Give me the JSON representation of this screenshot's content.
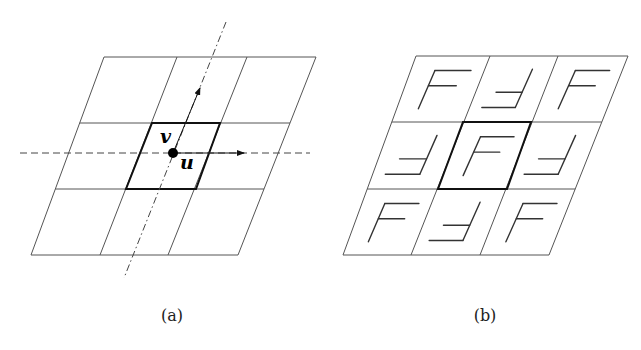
{
  "figure": {
    "panel_a": {
      "caption": "(a)",
      "vector_u": "u",
      "vector_v": "v",
      "grid": {
        "top_y": 57,
        "bottom_y": 255,
        "row_ys": [
          57,
          123,
          189,
          255
        ],
        "top_xs": [
          104,
          177,
          247,
          316
        ],
        "bottom_xs": [
          31,
          100,
          168,
          238
        ]
      },
      "center_cell": [
        [
          152,
          123
        ],
        [
          220,
          123
        ],
        [
          196,
          189
        ],
        [
          126,
          189
        ]
      ],
      "origin": [
        173,
        153
      ],
      "u_arrow_end": [
        244,
        153
      ],
      "v_arrow_end": [
        200,
        88
      ],
      "horizontal_axis": [
        [
          20,
          153
        ],
        [
          310,
          153
        ]
      ],
      "tilted_axis": [
        [
          226,
          22
        ],
        [
          124,
          278
        ]
      ]
    },
    "panel_b": {
      "caption": "(b)",
      "grid": {
        "row_ys": [
          56,
          122,
          189,
          255
        ],
        "top_xs": [
          416,
          490,
          558,
          628
        ],
        "bottom_xs": [
          343,
          411,
          480,
          549
        ]
      },
      "center_cell": [
        [
          463,
          122
        ],
        [
          531,
          122
        ],
        [
          507,
          189
        ],
        [
          438,
          189
        ]
      ],
      "glyph_pattern": [
        [
          "F",
          "rotated-F",
          "F"
        ],
        [
          "rotated-F",
          "F",
          "rotated-F"
        ],
        [
          "F",
          "rotated-F",
          "F"
        ]
      ]
    },
    "colors": {
      "line": "#555555",
      "bold_line": "#111111",
      "dashed": "#444444"
    }
  }
}
